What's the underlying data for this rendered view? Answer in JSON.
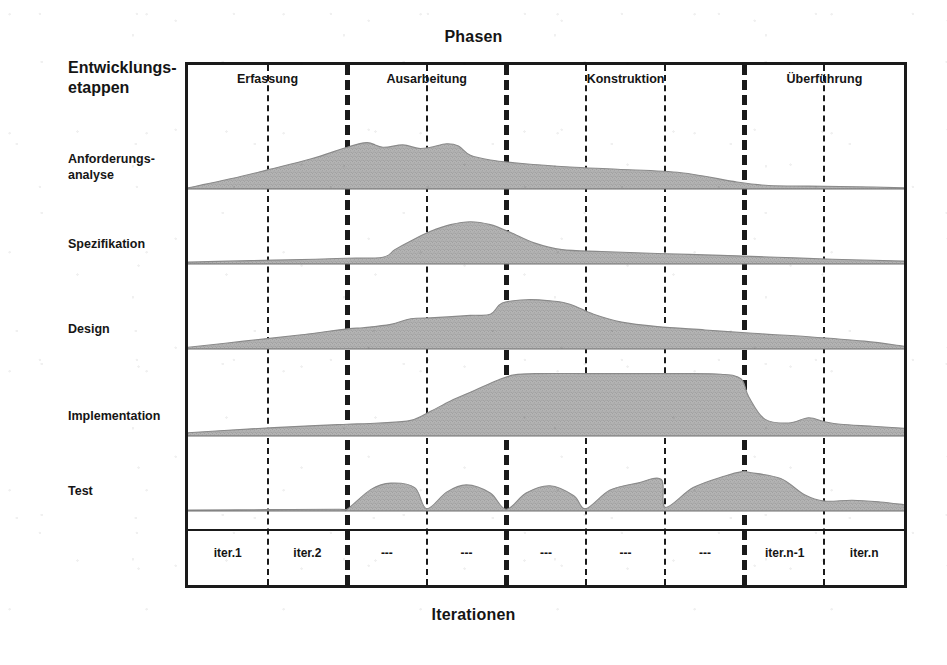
{
  "chart_title": "Phasen",
  "bottom_axis_title": "Iterationen",
  "y_axis_title": "Entwicklungs-\netappen",
  "colors": {
    "ink": "#1a1a1a",
    "fill": "#b4b4b4",
    "fill_edge": "#8a8a8a",
    "paper": "#ffffff"
  },
  "chart_data": {
    "type": "area",
    "title": "Phasen",
    "xlabel": "Iterationen",
    "ylabel": "Entwicklungsetappen",
    "grid": true,
    "legend": "none",
    "xlim": [
      0,
      9
    ],
    "ylim": [
      0,
      1
    ],
    "phases": [
      {
        "label": "Erfassung",
        "start": 0,
        "end": 2
      },
      {
        "label": "Ausarbeitung",
        "start": 2,
        "end": 4
      },
      {
        "label": "Konstruktion",
        "start": 4,
        "end": 7
      },
      {
        "label": "Überführung",
        "start": 7,
        "end": 9
      }
    ],
    "iterations": [
      "iter.1",
      "iter.2",
      "---",
      "---",
      "---",
      "---",
      "---",
      "iter.n-1",
      "iter.n"
    ],
    "dividers": [
      {
        "at": 1,
        "weight": "thin"
      },
      {
        "at": 2,
        "weight": "thick"
      },
      {
        "at": 3,
        "weight": "thin"
      },
      {
        "at": 4,
        "weight": "thick"
      },
      {
        "at": 5,
        "weight": "thin"
      },
      {
        "at": 6,
        "weight": "thin"
      },
      {
        "at": 7,
        "weight": "thick"
      },
      {
        "at": 8,
        "weight": "thin"
      }
    ],
    "series": [
      {
        "name": "Anforderungs-\nanalyse",
        "label_line1": "Anforderungs-",
        "label_line2": "analyse",
        "x": [
          0.0,
          0.55,
          1.0,
          1.55,
          2.0,
          2.25,
          2.45,
          2.7,
          2.9,
          3.05,
          3.25,
          3.4,
          3.55,
          3.8,
          4.2,
          4.8,
          5.4,
          6.2,
          6.9,
          7.3,
          7.8,
          8.4,
          9.0
        ],
        "values": [
          0.02,
          0.18,
          0.33,
          0.52,
          0.72,
          0.8,
          0.72,
          0.76,
          0.7,
          0.72,
          0.78,
          0.74,
          0.58,
          0.5,
          0.44,
          0.38,
          0.34,
          0.28,
          0.12,
          0.06,
          0.05,
          0.04,
          0.02
        ]
      },
      {
        "name": "Spezifikation",
        "label_line1": "Spezifikation",
        "label_line2": "",
        "x": [
          0.0,
          0.8,
          1.6,
          2.0,
          2.45,
          2.6,
          2.8,
          3.05,
          3.3,
          3.55,
          3.8,
          4.05,
          4.35,
          4.7,
          5.2,
          5.9,
          6.7,
          7.4,
          8.1,
          9.0
        ],
        "values": [
          0.04,
          0.07,
          0.1,
          0.12,
          0.14,
          0.3,
          0.48,
          0.68,
          0.82,
          0.88,
          0.82,
          0.66,
          0.44,
          0.3,
          0.26,
          0.22,
          0.18,
          0.14,
          0.1,
          0.06
        ]
      },
      {
        "name": "Design",
        "label_line1": "Design",
        "label_line2": "",
        "x": [
          0.0,
          0.7,
          1.4,
          2.0,
          2.2,
          2.55,
          2.8,
          3.1,
          3.55,
          3.8,
          3.95,
          4.25,
          4.55,
          4.8,
          5.1,
          5.45,
          5.9,
          6.5,
          7.1,
          7.8,
          8.5,
          9.0
        ],
        "values": [
          0.03,
          0.14,
          0.25,
          0.36,
          0.38,
          0.44,
          0.54,
          0.56,
          0.6,
          0.62,
          0.82,
          0.88,
          0.86,
          0.8,
          0.62,
          0.48,
          0.4,
          0.34,
          0.28,
          0.22,
          0.14,
          0.05
        ]
      },
      {
        "name": "Implementation",
        "label_line1": "Implementation",
        "label_line2": "",
        "x": [
          0.0,
          0.8,
          1.6,
          2.0,
          2.4,
          2.8,
          3.05,
          3.3,
          3.6,
          3.9,
          4.1,
          4.4,
          5.0,
          5.6,
          6.2,
          6.7,
          6.95,
          7.05,
          7.25,
          7.55,
          7.8,
          8.0,
          8.2,
          8.6,
          9.0
        ],
        "values": [
          0.05,
          0.11,
          0.16,
          0.18,
          0.2,
          0.24,
          0.38,
          0.54,
          0.7,
          0.86,
          0.94,
          0.96,
          0.96,
          0.96,
          0.96,
          0.95,
          0.88,
          0.6,
          0.26,
          0.2,
          0.28,
          0.22,
          0.18,
          0.15,
          0.12
        ]
      },
      {
        "name": "Test",
        "label_line1": "Test",
        "label_line2": "",
        "x": [
          0.0,
          1.0,
          1.9,
          2.0,
          2.3,
          2.55,
          2.85,
          3.0,
          3.25,
          3.5,
          3.8,
          4.0,
          4.25,
          4.55,
          4.85,
          5.0,
          5.3,
          5.65,
          5.95,
          6.0,
          6.35,
          6.75,
          6.98,
          7.05,
          7.45,
          7.75,
          8.0,
          8.35,
          8.7,
          9.0
        ],
        "values": [
          0.02,
          0.03,
          0.04,
          0.04,
          0.48,
          0.62,
          0.52,
          0.05,
          0.42,
          0.58,
          0.4,
          0.04,
          0.4,
          0.56,
          0.34,
          0.05,
          0.46,
          0.62,
          0.7,
          0.08,
          0.52,
          0.78,
          0.88,
          0.86,
          0.72,
          0.36,
          0.22,
          0.24,
          0.2,
          0.14
        ]
      }
    ]
  }
}
